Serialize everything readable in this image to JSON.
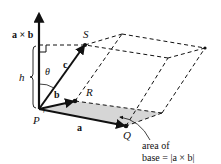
{
  "diagram": {
    "labels": {
      "axb": "a × b",
      "h": "h",
      "theta": "θ",
      "c": "c",
      "b": "b",
      "a": "a",
      "P": "P",
      "Q": "Q",
      "R": "R",
      "S": "S",
      "area_line1": "area of",
      "area_line2": "base = |a × b|"
    },
    "colors": {
      "ink": "#111111",
      "base_fill": "#d6d6d6"
    }
  }
}
